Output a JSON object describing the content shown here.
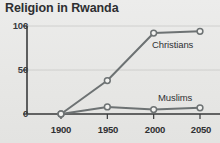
{
  "chart_data": {
    "type": "line",
    "title": "Religion in Rwanda",
    "xlabel": "",
    "ylabel": "",
    "categories": [
      "1900",
      "1950",
      "2000",
      "2050"
    ],
    "x": [
      1900,
      1950,
      2000,
      2050
    ],
    "xlim": [
      1900,
      2050
    ],
    "ylim": [
      0,
      100
    ],
    "yticks": [
      "0",
      "50",
      "100"
    ],
    "ytick_values": [
      0,
      50,
      100
    ],
    "grid": true,
    "grid_axis": "y",
    "legend": "inline-labels",
    "marker": "open-circle",
    "series": [
      {
        "name": "Christians",
        "values": [
          0,
          38,
          92,
          94
        ],
        "color": "#6d7273"
      },
      {
        "name": "Muslims",
        "values": [
          0,
          8,
          5,
          7
        ],
        "color": "#6d7273"
      }
    ],
    "annotations": [
      {
        "text": "Christians",
        "x": 2010,
        "y": 70
      },
      {
        "text": "Muslims",
        "x": 2010,
        "y": 22
      }
    ],
    "colors": {
      "background": "#e9e9e7",
      "line": "#6d7273",
      "axis": "#3a3b3d",
      "grid": "#c9c9c6",
      "marker_fill": "#f2f2f0",
      "title_text": "#2e2f31",
      "tick_text": "#323335"
    }
  }
}
